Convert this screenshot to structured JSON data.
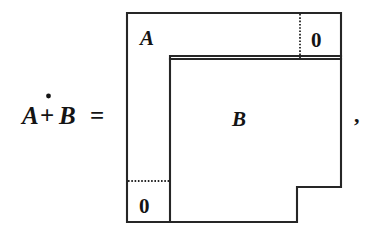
{
  "figure": {
    "kind": "block-matrix-direct-sum-diagram",
    "caption_text": "A +̇ B =",
    "expression": {
      "left_operand": "A",
      "operator_glyph": "∔",
      "operator_name": "dot-plus",
      "right_operand": "B",
      "equals_sign": "="
    },
    "trailing_punctuation": ",",
    "blocks": [
      {
        "id": "block-a",
        "label": "A",
        "role": "upper-left-block",
        "x": 127,
        "y": 13,
        "width": 173,
        "height": 46
      },
      {
        "id": "block-zero-top-right",
        "label": "0",
        "role": "upper-right-zero-block",
        "x": 300,
        "y": 13,
        "width": 41,
        "height": 46
      },
      {
        "id": "block-b",
        "label": "B",
        "role": "lower-right-block",
        "x": 170,
        "y": 56,
        "width": 171,
        "height": 166
      },
      {
        "id": "block-zero-bottom-left",
        "label": "0",
        "role": "lower-left-zero-block",
        "x": 127,
        "y": 181,
        "width": 43,
        "height": 41
      }
    ],
    "labels": {
      "a_label": "A",
      "b_label": "B",
      "zero_top_right": "0",
      "zero_bottom_left": "0"
    },
    "colors": {
      "stroke": "#262626",
      "text": "#141414",
      "background": "#ffffff"
    },
    "line_styles": {
      "outline": "solid",
      "zero_block_separator": "dotted"
    },
    "geometry": {
      "outer_left": 127,
      "outer_top": 13,
      "outer_right": 341,
      "outer_bottom": 222,
      "b_left": 170,
      "b_top": 56,
      "a_bottom_at_b_left": 59,
      "notch_x": 297,
      "notch_y": 187,
      "dotted_vertical_x": 300,
      "dotted_vertical_y1": 13,
      "dotted_vertical_y2": 59,
      "dotted_horizontal_y": 181,
      "dotted_horizontal_x1": 127,
      "dotted_horizontal_x2": 170
    }
  }
}
